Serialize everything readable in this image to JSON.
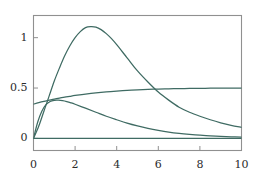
{
  "chart_data": {
    "type": "line",
    "title": "",
    "subtitle": "",
    "xlabel": "",
    "ylabel": "",
    "xlim": [
      0,
      10
    ],
    "ylim": [
      -0.12,
      1.22
    ],
    "xticks": [
      0,
      2,
      4,
      6,
      8,
      10
    ],
    "xtick_labels": [
      "0",
      "2",
      "4",
      "6",
      "8",
      "10"
    ],
    "yticks": [
      0,
      0.5,
      1
    ],
    "ytick_labels": [
      "0",
      "0.5",
      "1"
    ],
    "grid": false,
    "legend": null,
    "frame": true,
    "line_color": "#3f6b63",
    "frame_color": "#909090",
    "background": "#ffffff",
    "annotations": [],
    "series": [
      {
        "name": "hump",
        "description": "rises from 0 to peak 1.11 near x=2.75 then decays to 0.11 at x=10",
        "x": [
          0,
          0.25,
          0.5,
          0.75,
          1,
          1.25,
          1.5,
          1.75,
          2,
          2.25,
          2.5,
          2.75,
          3,
          3.25,
          3.5,
          3.75,
          4,
          4.5,
          5,
          5.5,
          6,
          6.5,
          7,
          7.5,
          8,
          8.5,
          9,
          9.5,
          10
        ],
        "y": [
          0,
          0.12,
          0.27,
          0.42,
          0.57,
          0.7,
          0.82,
          0.92,
          1.0,
          1.06,
          1.1,
          1.11,
          1.105,
          1.08,
          1.04,
          0.99,
          0.93,
          0.8,
          0.67,
          0.56,
          0.46,
          0.38,
          0.31,
          0.26,
          0.22,
          0.185,
          0.155,
          0.13,
          0.11
        ]
      },
      {
        "name": "rising-plateau",
        "description": "starts at 0.34, rises monotonically, asymptotes to 0.5",
        "x": [
          0,
          0.25,
          0.5,
          0.75,
          1,
          1.25,
          1.5,
          1.75,
          2,
          2.5,
          3,
          3.5,
          4,
          4.5,
          5,
          5.5,
          6,
          6.5,
          7,
          7.5,
          8,
          8.5,
          9,
          9.5,
          10
        ],
        "y": [
          0.34,
          0.355,
          0.368,
          0.379,
          0.39,
          0.4,
          0.41,
          0.418,
          0.426,
          0.44,
          0.452,
          0.462,
          0.47,
          0.477,
          0.482,
          0.486,
          0.49,
          0.492,
          0.494,
          0.496,
          0.497,
          0.498,
          0.499,
          0.4995,
          0.5
        ]
      },
      {
        "name": "small-hump-decay",
        "description": "starts at 0, rises to 0.38 near x=1.2, decays toward 0",
        "x": [
          0,
          0.2,
          0.4,
          0.6,
          0.8,
          1,
          1.2,
          1.4,
          1.6,
          1.8,
          2,
          2.5,
          3,
          3.5,
          4,
          4.5,
          5,
          5.5,
          6,
          6.5,
          7,
          7.5,
          8,
          8.5,
          9,
          9.5,
          10
        ],
        "y": [
          0,
          0.16,
          0.27,
          0.335,
          0.367,
          0.378,
          0.379,
          0.374,
          0.365,
          0.353,
          0.339,
          0.3,
          0.26,
          0.22,
          0.185,
          0.152,
          0.124,
          0.1,
          0.08,
          0.063,
          0.05,
          0.04,
          0.032,
          0.025,
          0.02,
          0.016,
          0.013
        ]
      },
      {
        "name": "zero-baseline",
        "description": "flat line at y=0",
        "x": [
          0,
          10
        ],
        "y": [
          0,
          0
        ]
      }
    ]
  }
}
